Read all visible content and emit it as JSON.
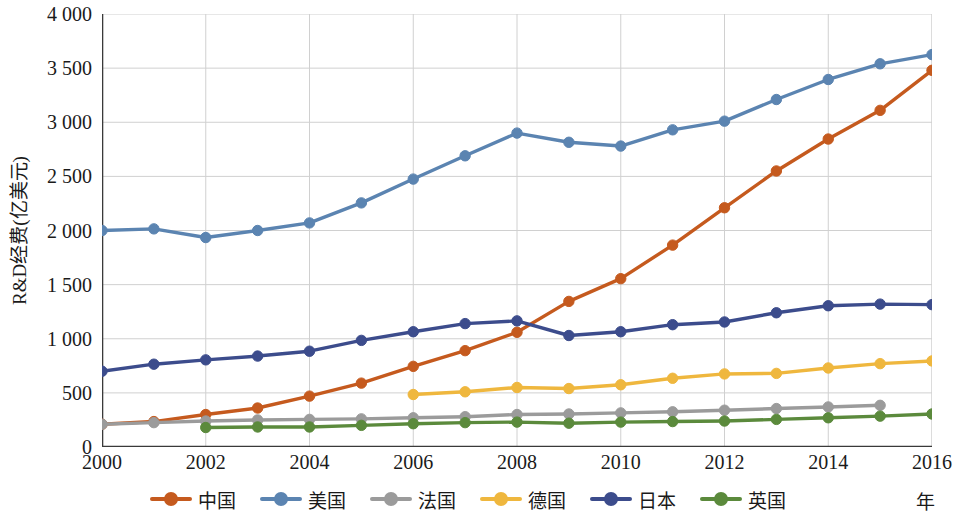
{
  "chart_data": {
    "type": "line",
    "title": "",
    "xlabel": "年",
    "ylabel": "R&D经费(亿美元)",
    "xlim": [
      2000,
      2016
    ],
    "ylim": [
      0,
      4000
    ],
    "ytick_step": 500,
    "grid": true,
    "legend_position": "bottom",
    "x": [
      2000,
      2001,
      2002,
      2003,
      2004,
      2005,
      2006,
      2007,
      2008,
      2009,
      2010,
      2011,
      2012,
      2013,
      2014,
      2015,
      2016
    ],
    "xticks": [
      "2000",
      "2002",
      "2004",
      "2006",
      "2008",
      "2010",
      "2012",
      "2014",
      "2016"
    ],
    "yticks": [
      "0",
      "500",
      "1 000",
      "1 500",
      "2 000",
      "2 500",
      "3 000",
      "3 500",
      "4 000"
    ],
    "series": [
      {
        "name": "中国",
        "color": "#C55A1E",
        "x": [
          2000,
          2001,
          2002,
          2003,
          2004,
          2005,
          2006,
          2007,
          2008,
          2009,
          2010,
          2011,
          2012,
          2013,
          2014,
          2015,
          2016
        ],
        "values": [
          210,
          235,
          300,
          360,
          470,
          590,
          745,
          890,
          1060,
          1345,
          1555,
          1865,
          2210,
          2550,
          2845,
          3110,
          3480
        ]
      },
      {
        "name": "美国",
        "color": "#5B84B1",
        "x": [
          2000,
          2001,
          2002,
          2003,
          2004,
          2005,
          2006,
          2007,
          2008,
          2009,
          2010,
          2011,
          2012,
          2013,
          2014,
          2015,
          2016
        ],
        "values": [
          2000,
          2015,
          1935,
          2000,
          2070,
          2255,
          2475,
          2690,
          2900,
          2815,
          2780,
          2930,
          3010,
          3210,
          3395,
          3540,
          3625
        ]
      },
      {
        "name": "法国",
        "color": "#9B9B9B",
        "x": [
          2000,
          2001,
          2002,
          2003,
          2004,
          2005,
          2006,
          2007,
          2008,
          2009,
          2010,
          2011,
          2012,
          2013,
          2014,
          2015
        ],
        "values": [
          210,
          225,
          240,
          250,
          255,
          260,
          270,
          280,
          300,
          305,
          315,
          325,
          340,
          355,
          370,
          385
        ]
      },
      {
        "name": "德国",
        "color": "#EFB73E",
        "x": [
          2006,
          2007,
          2008,
          2009,
          2010,
          2011,
          2012,
          2013,
          2014,
          2015,
          2016
        ],
        "values": [
          485,
          510,
          550,
          540,
          575,
          635,
          675,
          680,
          730,
          770,
          795
        ]
      },
      {
        "name": "日本",
        "color": "#3C4C8C",
        "x": [
          2000,
          2001,
          2002,
          2003,
          2004,
          2005,
          2006,
          2007,
          2008,
          2009,
          2010,
          2011,
          2012,
          2013,
          2014,
          2015,
          2016
        ],
        "values": [
          700,
          765,
          805,
          840,
          885,
          985,
          1065,
          1140,
          1165,
          1030,
          1065,
          1130,
          1155,
          1240,
          1305,
          1320,
          1315
        ]
      },
      {
        "name": "英国",
        "color": "#5B8A3C",
        "x": [
          2002,
          2003,
          2004,
          2005,
          2006,
          2007,
          2008,
          2009,
          2010,
          2011,
          2012,
          2013,
          2014,
          2015,
          2016
        ],
        "values": [
          180,
          185,
          185,
          200,
          215,
          225,
          230,
          220,
          230,
          235,
          240,
          255,
          270,
          285,
          305
        ]
      }
    ]
  },
  "axis": {
    "y_title": "R&D经费(亿美元)",
    "x_title": "年"
  },
  "legend": {
    "items": [
      {
        "label": "中国",
        "color": "#C55A1E",
        "icon": "line-marker-icon"
      },
      {
        "label": "美国",
        "color": "#5B84B1",
        "icon": "line-marker-icon"
      },
      {
        "label": "法国",
        "color": "#9B9B9B",
        "icon": "line-marker-icon"
      },
      {
        "label": "德国",
        "color": "#EFB73E",
        "icon": "line-marker-icon"
      },
      {
        "label": "日本",
        "color": "#3C4C8C",
        "icon": "line-marker-icon"
      },
      {
        "label": "英国",
        "color": "#5B8A3C",
        "icon": "line-marker-icon"
      }
    ]
  }
}
